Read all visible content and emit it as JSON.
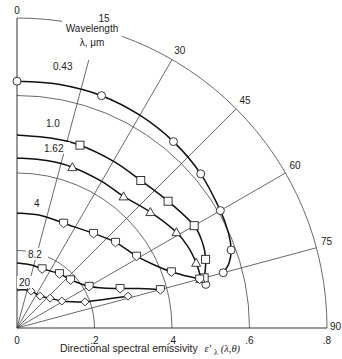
{
  "chart_data": {
    "type": "polar-line",
    "title": "",
    "xlabel": "Directional spectral emissivity ε'λ(λ,θ)",
    "xlabel_parts": {
      "main": "Directional spectral emissivity ",
      "symbol": "ε'",
      "sub": "λ",
      "args": "(λ,θ)"
    },
    "radial_ticks": [
      {
        "value": 0,
        "label": "0"
      },
      {
        "value": 0.2,
        "label": ".2"
      },
      {
        "value": 0.4,
        "label": ".4"
      },
      {
        "value": 0.6,
        "label": ".6"
      },
      {
        "value": 0.8,
        "label": ".8"
      }
    ],
    "angle_ticks": [
      {
        "deg": 0,
        "label": "0"
      },
      {
        "deg": 15,
        "label": "15"
      },
      {
        "deg": 30,
        "label": "30"
      },
      {
        "deg": 45,
        "label": "45"
      },
      {
        "deg": 60,
        "label": "60"
      },
      {
        "deg": 75,
        "label": "75"
      },
      {
        "deg": 90,
        "label": "90"
      }
    ],
    "angle_unit": "degrees",
    "rlim": [
      0,
      0.8
    ],
    "legend_title": [
      "Wavelength",
      "λ, μm"
    ],
    "series": [
      {
        "name": "0.43",
        "marker": "circle",
        "points": [
          [
            0,
            0.637
          ],
          [
            20,
            0.638
          ],
          [
            40,
            0.628
          ],
          [
            50,
            0.619
          ],
          [
            60,
            0.606
          ],
          [
            70,
            0.588
          ],
          [
            75,
            0.551
          ],
          [
            77,
            0.5
          ]
        ],
        "curve": [
          [
            0,
            0.637
          ],
          [
            10,
            0.638
          ],
          [
            20,
            0.638
          ],
          [
            30,
            0.634
          ],
          [
            40,
            0.628
          ],
          [
            50,
            0.619
          ],
          [
            60,
            0.606
          ],
          [
            66,
            0.598
          ],
          [
            70,
            0.588
          ],
          [
            73,
            0.572
          ],
          [
            75,
            0.551
          ]
        ]
      },
      {
        "name": "1.0",
        "marker": "square",
        "points": [
          [
            19,
            0.499
          ],
          [
            40,
            0.497
          ],
          [
            50,
            0.509
          ],
          [
            60,
            0.528
          ],
          [
            70,
            0.518
          ],
          [
            75,
            0.5
          ]
        ],
        "curve": [
          [
            0,
            0.498
          ],
          [
            10,
            0.498
          ],
          [
            19,
            0.499
          ],
          [
            30,
            0.497
          ],
          [
            40,
            0.497
          ],
          [
            50,
            0.509
          ],
          [
            60,
            0.528
          ],
          [
            66,
            0.526
          ],
          [
            70,
            0.518
          ],
          [
            73,
            0.508
          ],
          [
            75,
            0.5
          ]
        ]
      },
      {
        "name": "1.62",
        "marker": "triangle",
        "points": [
          [
            19,
            0.439
          ],
          [
            39,
            0.437
          ],
          [
            49,
            0.456
          ],
          [
            59,
            0.48
          ],
          [
            70,
            0.492
          ],
          [
            75,
            0.49
          ]
        ],
        "curve": [
          [
            0,
            0.439
          ],
          [
            10,
            0.439
          ],
          [
            19,
            0.439
          ],
          [
            30,
            0.437
          ],
          [
            39,
            0.437
          ],
          [
            49,
            0.456
          ],
          [
            59,
            0.48
          ],
          [
            65,
            0.489
          ],
          [
            70,
            0.492
          ],
          [
            73,
            0.492
          ],
          [
            75,
            0.49
          ]
        ]
      },
      {
        "name": "4",
        "marker": "pentagon",
        "points": [
          [
            24,
            0.296
          ],
          [
            39,
            0.314
          ],
          [
            49,
            0.337
          ],
          [
            59,
            0.36
          ],
          [
            70,
            0.424
          ],
          [
            75,
            0.488
          ]
        ],
        "curve": [
          [
            0,
            0.297
          ],
          [
            12,
            0.297
          ],
          [
            24,
            0.296
          ],
          [
            39,
            0.314
          ],
          [
            49,
            0.337
          ],
          [
            59,
            0.36
          ],
          [
            65,
            0.388
          ],
          [
            70,
            0.424
          ],
          [
            73,
            0.458
          ],
          [
            75,
            0.488
          ]
        ]
      },
      {
        "name": "8.2",
        "marker": "pentagon",
        "points": [
          [
            23,
            0.166
          ],
          [
            38,
            0.178
          ],
          [
            48,
            0.186
          ],
          [
            60,
            0.215
          ],
          [
            69,
            0.285
          ],
          [
            75,
            0.383
          ]
        ],
        "curve": [
          [
            0,
            0.168
          ],
          [
            12,
            0.167
          ],
          [
            23,
            0.166
          ],
          [
            38,
            0.178
          ],
          [
            48,
            0.186
          ],
          [
            60,
            0.215
          ],
          [
            65,
            0.245
          ],
          [
            69,
            0.285
          ],
          [
            72,
            0.33
          ],
          [
            75,
            0.383
          ]
        ]
      },
      {
        "name": "20",
        "marker": "diamond",
        "points": [
          [
            21,
            0.102
          ],
          [
            36,
            0.102
          ],
          [
            48,
            0.115
          ],
          [
            59,
            0.135
          ],
          [
            69,
            0.188
          ],
          [
            74,
            0.298
          ]
        ],
        "curve": [
          [
            0,
            0.098
          ],
          [
            10,
            0.1
          ],
          [
            21,
            0.102
          ],
          [
            36,
            0.102
          ],
          [
            48,
            0.115
          ],
          [
            59,
            0.135
          ],
          [
            65,
            0.16
          ],
          [
            69,
            0.188
          ],
          [
            72,
            0.24
          ],
          [
            74,
            0.298
          ]
        ]
      }
    ]
  },
  "labels": {
    "legend_line1": "Wavelength",
    "legend_line2": "λ, μm",
    "xlabel_main": "Directional spectral emissivity",
    "xlabel_symbol": "ε'",
    "xlabel_sub": "λ",
    "xlabel_args": "(λ,θ)"
  },
  "series_label_positions": [
    {
      "name": "0.43",
      "x": 53,
      "y": 70
    },
    {
      "name": "1.0",
      "x": 46,
      "y": 127
    },
    {
      "name": "1.62",
      "x": 44,
      "y": 152
    },
    {
      "name": "4",
      "x": 34,
      "y": 207
    },
    {
      "name": "8.2",
      "x": 28,
      "y": 258
    },
    {
      "name": "20",
      "x": 19,
      "y": 286
    }
  ]
}
